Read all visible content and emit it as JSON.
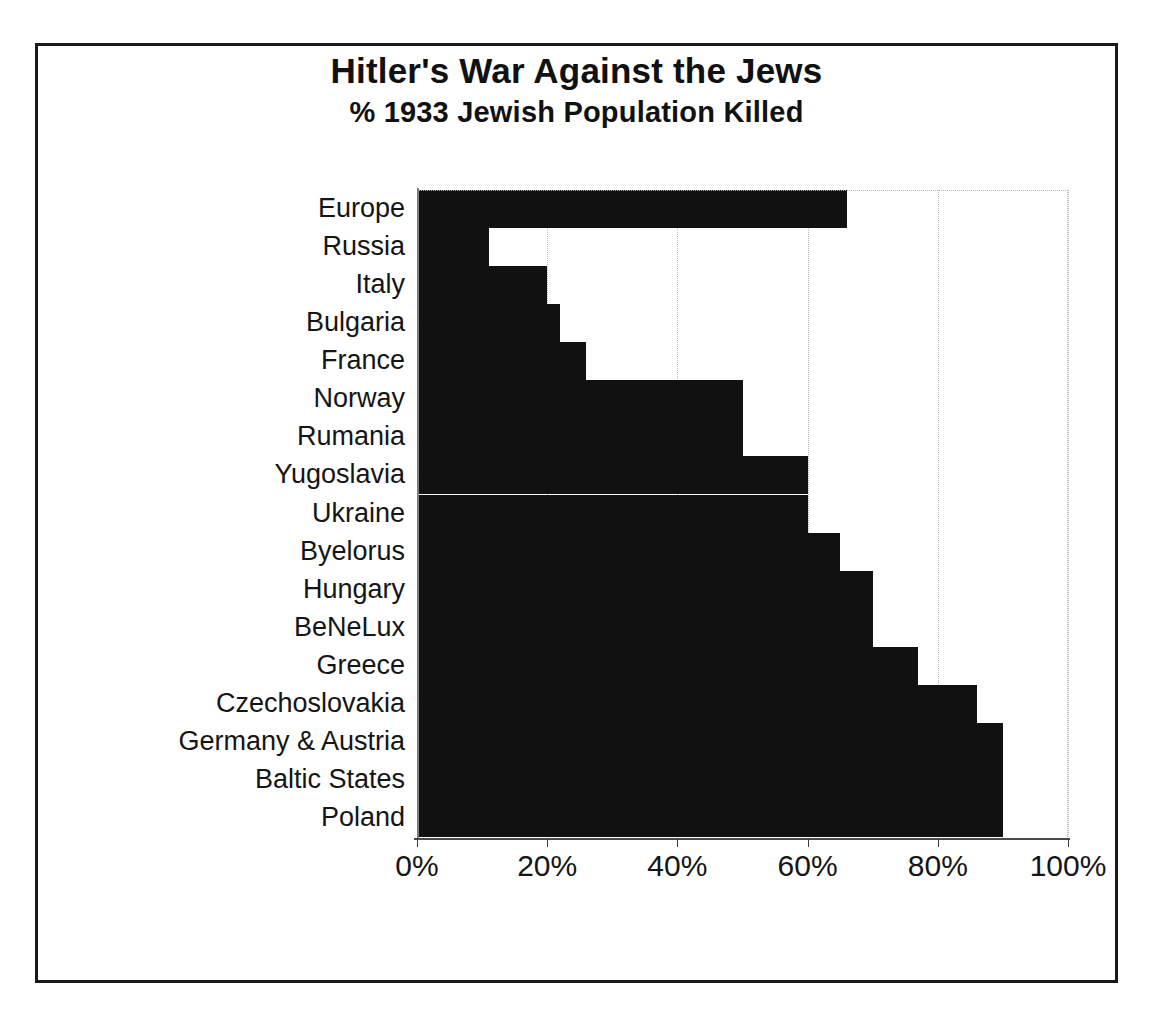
{
  "chart_data": {
    "type": "bar",
    "orientation": "horizontal",
    "title": "Hitler's War Against the Jews",
    "subtitle": "% 1933 Jewish Population Killed",
    "xlabel": "",
    "ylabel": "",
    "xlim": [
      0,
      100
    ],
    "xticks": [
      0,
      20,
      40,
      60,
      80,
      100
    ],
    "xtick_labels": [
      "0%",
      "20%",
      "40%",
      "60%",
      "80%",
      "100%"
    ],
    "grid": true,
    "legend": false,
    "bar_color": "#111111",
    "categories": [
      "Europe",
      "Russia",
      "Italy",
      "Bulgaria",
      "France",
      "Norway",
      "Rumania",
      "Yugoslavia",
      "Ukraine",
      "Byelorus",
      "Hungary",
      "BeNeLux",
      "Greece",
      "Czechoslovakia",
      "Germany & Austria",
      "Baltic States",
      "Poland"
    ],
    "values": [
      66,
      11,
      20,
      22,
      26,
      50,
      50,
      60,
      60,
      65,
      70,
      70,
      77,
      86,
      90,
      90,
      90
    ],
    "units": "percent"
  },
  "colors": {
    "bar": "#111111",
    "frame": "#1a1a1a",
    "grid": "#bdbdbd",
    "axis": "#4a4a4a",
    "text": "#151515",
    "background": "#ffffff"
  }
}
